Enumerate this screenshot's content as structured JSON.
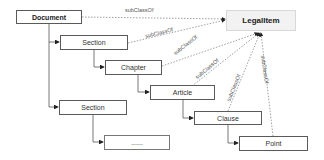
{
  "diagram": {
    "nodes": [
      {
        "id": "document",
        "label": "Document"
      },
      {
        "id": "section1",
        "label": "Section"
      },
      {
        "id": "chapter",
        "label": "Chapter"
      },
      {
        "id": "article",
        "label": "Article"
      },
      {
        "id": "clause",
        "label": "Clause"
      },
      {
        "id": "point",
        "label": "Point"
      },
      {
        "id": "section2",
        "label": "Section"
      },
      {
        "id": "ellipsis",
        "label": "......"
      },
      {
        "id": "legalitem",
        "label": "LegalItem"
      }
    ],
    "edge_label": "subClassOf",
    "subclass_edges": [
      {
        "from": "Document",
        "to": "LegalItem",
        "label": "subClassOf"
      },
      {
        "from": "Section",
        "to": "LegalItem",
        "label": "subClassOf"
      },
      {
        "from": "Chapter",
        "to": "LegalItem",
        "label": "subClassOf"
      },
      {
        "from": "Article",
        "to": "LegalItem",
        "label": "subClassOf"
      },
      {
        "from": "Clause",
        "to": "LegalItem",
        "label": "subClassOf"
      },
      {
        "from": "Point",
        "to": "LegalItem",
        "label": "subClassOf"
      }
    ],
    "containment_edges": [
      {
        "from": "Document",
        "to": "Section"
      },
      {
        "from": "Section",
        "to": "Chapter"
      },
      {
        "from": "Chapter",
        "to": "Article"
      },
      {
        "from": "Article",
        "to": "Clause"
      },
      {
        "from": "Clause",
        "to": "Point"
      },
      {
        "from": "Document",
        "to": "Section (2)"
      },
      {
        "from": "Section (2)",
        "to": "......"
      }
    ]
  }
}
